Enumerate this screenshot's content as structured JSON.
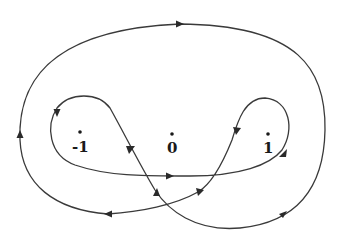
{
  "diagram": {
    "points": [
      {
        "label": "-1",
        "x": 78,
        "y": 131
      },
      {
        "label": "0",
        "x": 172,
        "y": 133
      },
      {
        "label": "1",
        "x": 267,
        "y": 133
      }
    ],
    "labels": {
      "minus_one": "-1",
      "zero": "0",
      "one": "1"
    },
    "stroke_color": "#3a3a3a",
    "background": "#ffffff"
  }
}
